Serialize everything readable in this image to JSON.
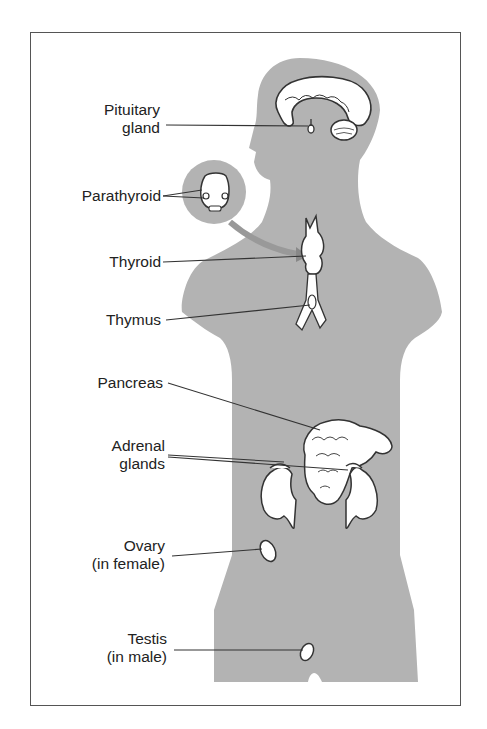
{
  "diagram": {
    "colors": {
      "frame": "#555555",
      "silhouette": "#b3b3b3",
      "organ_fill": "#ffffff",
      "organ_stroke": "#333333",
      "leader_line": "#333333",
      "text": "#222222"
    },
    "labels": {
      "pituitary": {
        "line1": "Pituitary",
        "line2": "gland"
      },
      "parathyroid": {
        "line1": "Parathyroid"
      },
      "thyroid": {
        "line1": "Thyroid"
      },
      "thymus": {
        "line1": "Thymus"
      },
      "pancreas": {
        "line1": "Pancreas"
      },
      "adrenal": {
        "line1": "Adrenal",
        "line2": "glands"
      },
      "ovary": {
        "line1": "Ovary",
        "line2": "(in female)"
      },
      "testis": {
        "line1": "Testis",
        "line2": "(in male)"
      }
    }
  }
}
